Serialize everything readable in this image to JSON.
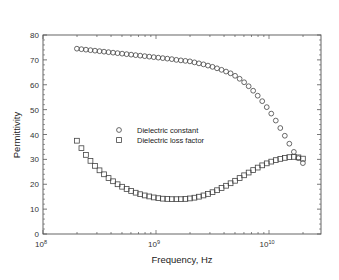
{
  "chart_data": {
    "type": "scatter",
    "title": "",
    "xlabel": "Frequency, Hz",
    "ylabel": "Permittivity",
    "xscale": "log",
    "xlim": [
      100000000.0,
      29000000000.0
    ],
    "ylim": [
      0,
      80
    ],
    "x_ticks": [
      {
        "value_log10": 8,
        "label_base": "10",
        "label_exp": "8"
      },
      {
        "value_log10": 9,
        "label_base": "10",
        "label_exp": "9"
      },
      {
        "value_log10": 10,
        "label_base": "10",
        "label_exp": "10"
      }
    ],
    "y_ticks": [
      0,
      10,
      20,
      30,
      40,
      50,
      60,
      70,
      80
    ],
    "grid": false,
    "legend_position": "center-left inside plot",
    "series": [
      {
        "name": "Dielectric constant",
        "marker": "circle",
        "x_log10": [
          8.3,
          8.34,
          8.38,
          8.42,
          8.46,
          8.5,
          8.54,
          8.58,
          8.62,
          8.66,
          8.7,
          8.74,
          8.78,
          8.82,
          8.86,
          8.9,
          8.94,
          8.98,
          9.02,
          9.06,
          9.1,
          9.14,
          9.18,
          9.22,
          9.26,
          9.3,
          9.34,
          9.38,
          9.42,
          9.46,
          9.5,
          9.54,
          9.58,
          9.62,
          9.66,
          9.7,
          9.74,
          9.78,
          9.82,
          9.86,
          9.9,
          9.94,
          9.98,
          10.02,
          10.06,
          10.1,
          10.14,
          10.18,
          10.22,
          10.26,
          10.3
        ],
        "values": [
          74.5,
          74.3,
          74.1,
          73.9,
          73.7,
          73.5,
          73.3,
          73.1,
          72.9,
          72.7,
          72.5,
          72.3,
          72.1,
          71.9,
          71.7,
          71.5,
          71.3,
          71.1,
          70.9,
          70.7,
          70.5,
          70.3,
          70.0,
          69.8,
          69.6,
          69.4,
          69.0,
          68.6,
          68.2,
          67.7,
          67.2,
          66.6,
          66.0,
          65.3,
          64.6,
          63.6,
          62.4,
          61.0,
          59.4,
          57.6,
          55.6,
          53.4,
          51.0,
          48.4,
          45.6,
          42.6,
          39.5,
          36.3,
          33.0,
          30.5,
          28.5
        ]
      },
      {
        "name": "Dielectric loss factor",
        "marker": "square",
        "x_log10": [
          8.3,
          8.34,
          8.38,
          8.42,
          8.46,
          8.5,
          8.54,
          8.58,
          8.62,
          8.66,
          8.7,
          8.74,
          8.78,
          8.82,
          8.86,
          8.9,
          8.94,
          8.98,
          9.02,
          9.06,
          9.1,
          9.14,
          9.18,
          9.22,
          9.26,
          9.3,
          9.34,
          9.38,
          9.42,
          9.46,
          9.5,
          9.54,
          9.58,
          9.62,
          9.66,
          9.7,
          9.74,
          9.78,
          9.82,
          9.86,
          9.9,
          9.94,
          9.98,
          10.02,
          10.06,
          10.1,
          10.14,
          10.18,
          10.22,
          10.26,
          10.3
        ],
        "values": [
          37.5,
          34.5,
          31.8,
          29.4,
          27.4,
          25.6,
          24.0,
          22.5,
          21.2,
          20.0,
          19.0,
          18.1,
          17.3,
          16.6,
          16.0,
          15.5,
          15.1,
          14.7,
          14.4,
          14.2,
          14.1,
          14.0,
          14.0,
          14.0,
          14.1,
          14.3,
          14.6,
          15.0,
          15.5,
          16.1,
          16.8,
          17.6,
          18.5,
          19.4,
          20.4,
          21.4,
          22.5,
          23.6,
          24.7,
          25.7,
          26.7,
          27.6,
          28.4,
          29.1,
          29.7,
          30.2,
          30.6,
          30.9,
          31.0,
          30.8,
          30.3
        ]
      }
    ]
  },
  "legend": {
    "items": [
      {
        "label": "Dielectric constant",
        "marker": "circle"
      },
      {
        "label": "Dielectric loss factor",
        "marker": "square"
      }
    ]
  },
  "axes": {
    "xlabel": "Frequency, Hz",
    "ylabel": "Permittivity"
  },
  "colors": {
    "marker_stroke": "#444444",
    "axis": "#555555",
    "text": "#222222"
  }
}
